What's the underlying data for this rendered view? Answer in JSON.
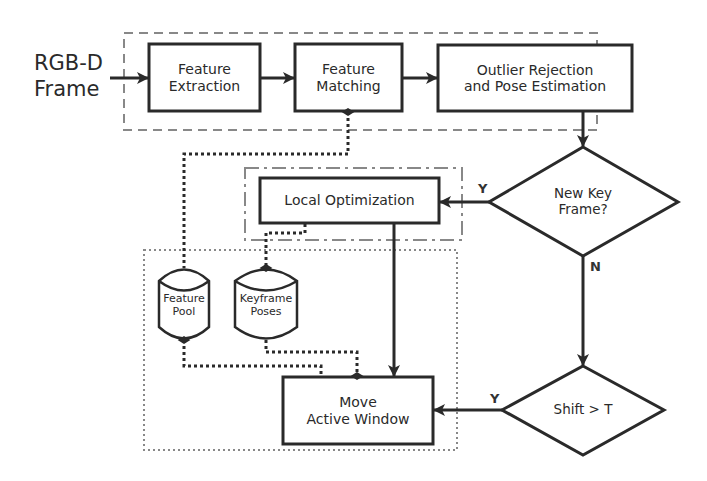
{
  "diagram": {
    "type": "flowchart",
    "input": {
      "line1": "RGB-D",
      "line2": "Frame"
    },
    "nodes": {
      "feature_extraction": {
        "line1": "Feature",
        "line2": "Extraction",
        "shape": "rectangle"
      },
      "feature_matching": {
        "line1": "Feature",
        "line2": "Matching",
        "shape": "rectangle"
      },
      "outlier_rejection": {
        "line1": "Outlier Rejection",
        "line2": "and Pose Estimation",
        "shape": "rectangle"
      },
      "new_key_frame": {
        "line1": "New Key",
        "line2": "Frame?",
        "shape": "diamond"
      },
      "local_optimization": {
        "label": "Local Optimization",
        "shape": "rectangle"
      },
      "shift_threshold": {
        "label": "Shift > T",
        "shape": "diamond"
      },
      "move_active_window": {
        "line1": "Move",
        "line2": "Active Window",
        "shape": "rectangle"
      },
      "feature_pool": {
        "line1": "Feature",
        "line2": "Pool",
        "shape": "database"
      },
      "keyframe_poses": {
        "line1": "Keyframe",
        "line2": "Poses",
        "shape": "database"
      }
    },
    "edge_labels": {
      "new_key_frame_yes": "Y",
      "new_key_frame_no": "N",
      "shift_yes": "Y"
    },
    "edges": [
      {
        "from": "input",
        "to": "feature_extraction",
        "style": "solid-arrow"
      },
      {
        "from": "feature_extraction",
        "to": "feature_matching",
        "style": "solid-arrow"
      },
      {
        "from": "feature_matching",
        "to": "outlier_rejection",
        "style": "solid-arrow"
      },
      {
        "from": "outlier_rejection",
        "to": "new_key_frame",
        "style": "solid-arrow"
      },
      {
        "from": "new_key_frame",
        "to": "local_optimization",
        "label": "Y",
        "style": "solid-arrow"
      },
      {
        "from": "new_key_frame",
        "to": "shift_threshold",
        "label": "N",
        "style": "solid-arrow"
      },
      {
        "from": "shift_threshold",
        "to": "move_active_window",
        "label": "Y",
        "style": "solid-arrow"
      },
      {
        "from": "local_optimization",
        "to": "move_active_window",
        "style": "solid-arrow"
      },
      {
        "from": "feature_matching",
        "to": "feature_pool",
        "style": "dotted-diamond"
      },
      {
        "from": "local_optimization",
        "to": "keyframe_poses",
        "style": "dotted-diamond"
      },
      {
        "from": "feature_pool",
        "to": "move_active_window",
        "style": "dotted-diamond"
      },
      {
        "from": "keyframe_poses",
        "to": "move_active_window",
        "style": "dotted-diamond"
      }
    ],
    "groups": [
      {
        "name": "front-end",
        "style": "dashed"
      },
      {
        "name": "optimization",
        "style": "dash-dot"
      },
      {
        "name": "active-window",
        "style": "dotted"
      }
    ],
    "colors": {
      "stroke": "#2a2a2a",
      "group_stroke": "#777777",
      "background": "#ffffff"
    }
  }
}
